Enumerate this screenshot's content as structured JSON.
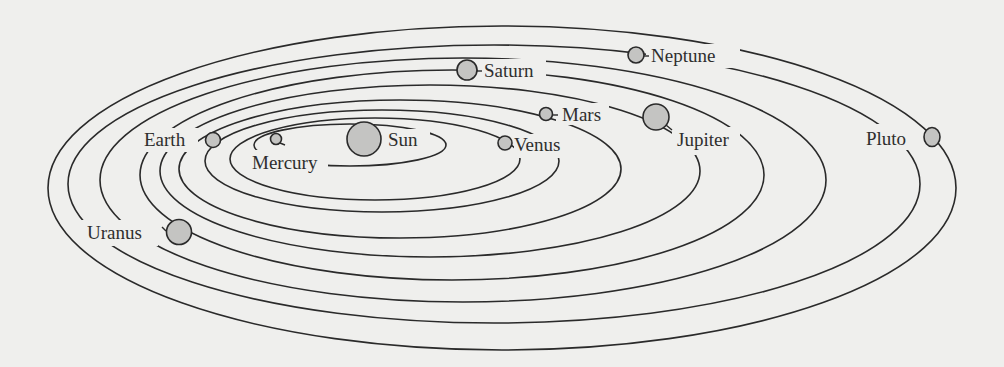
{
  "diagram": {
    "type": "solar-system-orbits",
    "background_color": "#efefed",
    "line_color": "#2a2a2a",
    "planet_fill": "#c4c4c2",
    "sun": {
      "label": "Sun"
    },
    "bodies": [
      {
        "name": "Mercury",
        "label": "Mercury",
        "order": 1
      },
      {
        "name": "Venus",
        "label": "Venus",
        "order": 2
      },
      {
        "name": "Earth",
        "label": "Earth",
        "order": 3
      },
      {
        "name": "Mars",
        "label": "Mars",
        "order": 4
      },
      {
        "name": "Jupiter",
        "label": "Jupiter",
        "order": 5
      },
      {
        "name": "Saturn",
        "label": "Saturn",
        "order": 6
      },
      {
        "name": "Uranus",
        "label": "Uranus",
        "order": 7
      },
      {
        "name": "Neptune",
        "label": "Neptune",
        "order": 8
      },
      {
        "name": "Pluto",
        "label": "Pluto",
        "order": 9
      }
    ]
  }
}
